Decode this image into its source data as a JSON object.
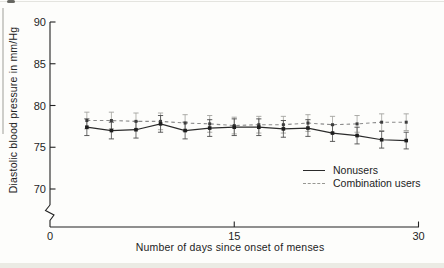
{
  "figure": {
    "ylabel": "Diastolic blood pressure in mm/Hg",
    "xlabel": "Number of days since onset of menses"
  },
  "legend": {
    "items": [
      {
        "label": "Nonusers",
        "style": "solid"
      },
      {
        "label": "Combination users",
        "style": "dashed"
      }
    ]
  },
  "chart_data": {
    "type": "line",
    "title": "",
    "xlabel": "Number of days since onset of menses",
    "ylabel": "Diastolic blood pressure in mm/Hg",
    "x": [
      3,
      5,
      7,
      9,
      11,
      13,
      15,
      17,
      19,
      21,
      23,
      25,
      27,
      29
    ],
    "series": [
      {
        "name": "Nonusers",
        "style": "solid",
        "color": "#2b2b2b",
        "values": [
          77.4,
          77.0,
          77.1,
          77.8,
          77.0,
          77.3,
          77.4,
          77.4,
          77.2,
          77.3,
          76.7,
          76.4,
          75.9,
          75.8
        ],
        "error": 1.0
      },
      {
        "name": "Combination users",
        "style": "dashed",
        "color": "#8b8b8b",
        "values": [
          78.2,
          78.2,
          78.1,
          78.1,
          77.9,
          77.8,
          77.6,
          77.7,
          77.7,
          77.9,
          77.7,
          77.8,
          78.0,
          78.0
        ],
        "error": 1.0
      }
    ],
    "xticks": [
      0,
      15,
      30
    ],
    "yticks": [
      90,
      85,
      80,
      75,
      70
    ],
    "xlim": [
      0,
      30
    ],
    "ylim": [
      70,
      90
    ],
    "axis_break_above_origin": true,
    "grid": false,
    "legend_position": "inside lower right",
    "colors": {
      "ink": "#222222",
      "error_bar_solid": "#4a4a4a",
      "error_bar_dashed": "#a3a39e"
    }
  }
}
